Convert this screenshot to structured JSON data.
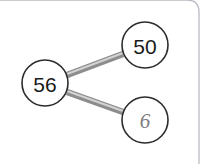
{
  "card": {
    "border_color": "#b9bcc2",
    "background": "#ffffff",
    "corner_radius": 12
  },
  "diagram": {
    "type": "number-bond",
    "circle_stroke_color": "#2b2b2b",
    "connector_color": "#9a9a9a",
    "connector_highlight_color": "#cfcfcf",
    "whole": {
      "label": "56",
      "cx": 45,
      "cy": 83,
      "r": 23,
      "text_color": "#1a1a1a",
      "style": "printed"
    },
    "parts": [
      {
        "name": "part-top",
        "label": "50",
        "cx": 145,
        "cy": 45,
        "r": 23,
        "text_color": "#1a1a1a",
        "style": "printed"
      },
      {
        "name": "part-bottom",
        "label": "6",
        "cx": 145,
        "cy": 120,
        "r": 23,
        "text_color": "#7d7d7d",
        "style": "handwritten"
      }
    ],
    "connectors": [
      {
        "name": "connector-to-top",
        "x1": 67,
        "y1": 75,
        "x2": 123,
        "y2": 54
      },
      {
        "name": "connector-to-bottom",
        "x1": 67,
        "y1": 92,
        "x2": 123,
        "y2": 112
      }
    ]
  }
}
